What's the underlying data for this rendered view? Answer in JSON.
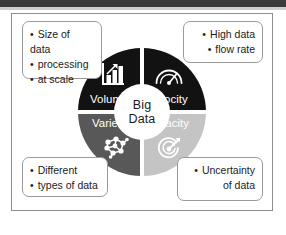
{
  "diagram": {
    "center": {
      "line1": "Big",
      "line2": "Data"
    },
    "colors": {
      "volume": "#121212",
      "velocity": "#121212",
      "variety": "#585858",
      "veracity": "#c4c4c4",
      "hub": "#ffffff",
      "frame": "#8e8e8e",
      "callout_border": "#9a9a9a",
      "text_dark": "#1b1b1b",
      "text_light": "#ffffff"
    },
    "quadrants": [
      {
        "key": "volume",
        "label": "Volume",
        "icon": "bar-chart-arrow-icon",
        "position": "top-left"
      },
      {
        "key": "velocity",
        "label": "Velocity",
        "icon": "speedometer-gauge-icon",
        "position": "top-right"
      },
      {
        "key": "variety",
        "label": "Variety",
        "icon": "network-nodes-icon",
        "position": "bottom-left"
      },
      {
        "key": "veracity",
        "label": "Veracity",
        "icon": "target-bullseye-arrow-icon",
        "position": "bottom-right"
      }
    ],
    "callouts": [
      {
        "key": "volume-callout",
        "position": "top-left",
        "align": "left",
        "lines": [
          {
            "bullet": true,
            "text": "Size of"
          },
          {
            "bullet": false,
            "text": "data"
          },
          {
            "bullet": true,
            "text": "processing"
          },
          {
            "bullet": true,
            "text": "at scale"
          }
        ]
      },
      {
        "key": "velocity-callout",
        "position": "top-right",
        "align": "right",
        "lines": [
          {
            "bullet": true,
            "text": "High data"
          },
          {
            "bullet": true,
            "text": "flow rate"
          }
        ]
      },
      {
        "key": "variety-callout",
        "position": "bottom-left",
        "align": "left",
        "lines": [
          {
            "bullet": true,
            "text": "Different"
          },
          {
            "bullet": true,
            "text": "types of data"
          }
        ]
      },
      {
        "key": "veracity-callout",
        "position": "bottom-right",
        "align": "right",
        "lines": [
          {
            "bullet": true,
            "text": "Uncertainty"
          },
          {
            "bullet": false,
            "text": "of data"
          }
        ]
      }
    ]
  }
}
